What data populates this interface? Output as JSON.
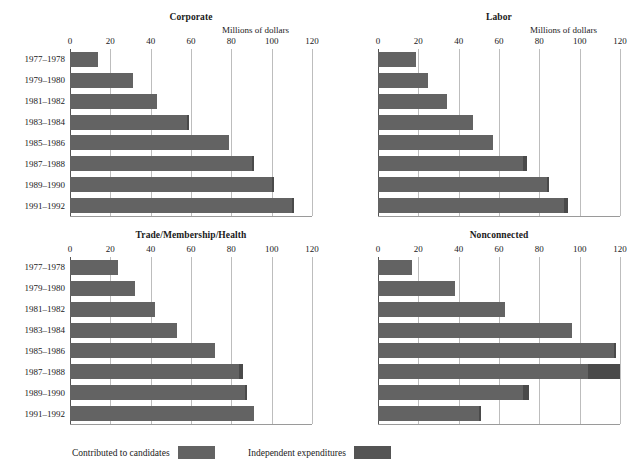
{
  "figure": {
    "units_label": "Millions of dollars",
    "axis": {
      "min": 0,
      "max": 120,
      "ticks": [
        0,
        20,
        40,
        60,
        80,
        100,
        120
      ]
    },
    "categories": [
      "1977–1978",
      "1979–1980",
      "1981–1982",
      "1983–1984",
      "1985–1986",
      "1987–1988",
      "1989–1990",
      "1991–1992"
    ],
    "colors": {
      "contributed": "#636363",
      "independent": "#4a4a4a",
      "gridline": "#bdbdbd"
    }
  },
  "legend": {
    "items": [
      {
        "label": "Contributed to candidates",
        "swatch": "contributed-swatch"
      },
      {
        "label": "Independent expenditures",
        "swatch": "independent-swatch"
      }
    ]
  },
  "chart_data": [
    {
      "type": "bar",
      "orientation": "horizontal",
      "title": "Corporate",
      "xlabel": "Millions of dollars",
      "ylabel": "",
      "xlim": [
        0,
        120
      ],
      "xticks": [
        0,
        20,
        40,
        60,
        80,
        100,
        120
      ],
      "grid": true,
      "stacked": true,
      "legend_position": "bottom",
      "categories": [
        "1977–1978",
        "1979–1980",
        "1981–1982",
        "1983–1984",
        "1985–1986",
        "1987–1988",
        "1989–1990",
        "1991–1992"
      ],
      "series": [
        {
          "name": "Contributed to candidates",
          "values": [
            14,
            31,
            43,
            58,
            79,
            90,
            100,
            110
          ]
        },
        {
          "name": "Independent expenditures",
          "values": [
            0,
            0,
            0,
            1,
            0,
            1,
            1,
            1
          ]
        }
      ],
      "totals": [
        14,
        31,
        43,
        59,
        79,
        91,
        101,
        111
      ]
    },
    {
      "type": "bar",
      "orientation": "horizontal",
      "title": "Labor",
      "xlabel": "Millions of dollars",
      "ylabel": "",
      "xlim": [
        0,
        120
      ],
      "xticks": [
        0,
        20,
        40,
        60,
        80,
        100,
        120
      ],
      "grid": true,
      "stacked": true,
      "legend_position": "bottom",
      "categories": [
        "1977–1978",
        "1979–1980",
        "1981–1982",
        "1983–1984",
        "1985–1986",
        "1987–1988",
        "1989–1990",
        "1991–1992"
      ],
      "series": [
        {
          "name": "Contributed to candidates",
          "values": [
            19,
            25,
            34,
            47,
            57,
            72,
            84,
            92
          ]
        },
        {
          "name": "Independent expenditures",
          "values": [
            0,
            0,
            0,
            0,
            0,
            2,
            1,
            2
          ]
        }
      ],
      "totals": [
        19,
        25,
        34,
        47,
        57,
        74,
        85,
        94
      ]
    },
    {
      "type": "bar",
      "orientation": "horizontal",
      "title": "Trade/Membership/Health",
      "xlabel": "",
      "ylabel": "",
      "xlim": [
        0,
        120
      ],
      "xticks": [
        0,
        20,
        40,
        60,
        80,
        100,
        120
      ],
      "grid": true,
      "stacked": true,
      "legend_position": "bottom",
      "categories": [
        "1977–1978",
        "1979–1980",
        "1981–1982",
        "1983–1984",
        "1985–1986",
        "1987–1988",
        "1989–1990",
        "1991–1992"
      ],
      "series": [
        {
          "name": "Contributed to candidates",
          "values": [
            24,
            32,
            42,
            53,
            72,
            84,
            87,
            91
          ]
        },
        {
          "name": "Independent expenditures",
          "values": [
            0,
            0,
            0,
            0,
            0,
            2,
            1,
            0
          ]
        }
      ],
      "totals": [
        24,
        32,
        42,
        53,
        72,
        86,
        88,
        91
      ]
    },
    {
      "type": "bar",
      "orientation": "horizontal",
      "title": "Nonconnected",
      "xlabel": "",
      "ylabel": "",
      "xlim": [
        0,
        120
      ],
      "xticks": [
        0,
        20,
        40,
        60,
        80,
        100,
        120
      ],
      "grid": true,
      "stacked": true,
      "legend_position": "bottom",
      "categories": [
        "1977–1978",
        "1979–1980",
        "1981–1982",
        "1983–1984",
        "1985–1986",
        "1987–1988",
        "1989–1990",
        "1991–1992"
      ],
      "series": [
        {
          "name": "Contributed to candidates",
          "values": [
            17,
            38,
            63,
            96,
            117,
            104,
            72,
            50
          ]
        },
        {
          "name": "Independent expenditures",
          "values": [
            0,
            0,
            0,
            0,
            1,
            16,
            3,
            1
          ]
        }
      ],
      "totals": [
        17,
        38,
        63,
        96,
        118,
        120,
        75,
        51
      ]
    }
  ]
}
